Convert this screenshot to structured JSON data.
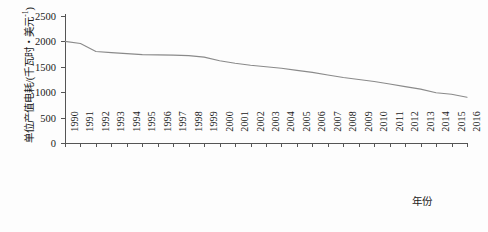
{
  "chart_data": {
    "type": "line",
    "title": "",
    "xlabel": "年份",
    "ylabel": "单位产值电耗/(千瓦时・美元",
    "ylabel_exponent": "-1",
    "ylabel_suffix": ")",
    "x": [
      1990,
      1991,
      1992,
      1993,
      1994,
      1995,
      1996,
      1997,
      1998,
      1999,
      2000,
      2001,
      2002,
      2003,
      2004,
      2005,
      2006,
      2007,
      2008,
      2009,
      2010,
      2011,
      2012,
      2013,
      2014,
      2015,
      2016
    ],
    "categories": [
      "1990",
      "1991",
      "1992",
      "1993",
      "1994",
      "1995",
      "1996",
      "1997",
      "1998",
      "1999",
      "2000",
      "2001",
      "2002",
      "2003",
      "2004",
      "2005",
      "2006",
      "2007",
      "2008",
      "2009",
      "2010",
      "2011",
      "2012",
      "2013",
      "2014",
      "2015",
      "2016"
    ],
    "values": [
      2000,
      1960,
      1800,
      1780,
      1760,
      1740,
      1735,
      1730,
      1720,
      1690,
      1620,
      1570,
      1530,
      1500,
      1470,
      1430,
      1390,
      1340,
      1290,
      1250,
      1210,
      1160,
      1110,
      1060,
      990,
      960,
      900
    ],
    "series": [
      {
        "name": "单位产值电耗",
        "values": [
          2000,
          1960,
          1800,
          1780,
          1760,
          1740,
          1735,
          1730,
          1720,
          1690,
          1620,
          1570,
          1530,
          1500,
          1470,
          1430,
          1390,
          1340,
          1290,
          1250,
          1210,
          1160,
          1110,
          1060,
          990,
          960,
          900
        ]
      }
    ],
    "yticks": [
      0,
      500,
      1000,
      1500,
      2000,
      2500
    ],
    "ytick_labels": [
      "0",
      "500",
      "1000",
      "1500",
      "2000",
      "2500"
    ],
    "ylim": [
      0,
      2500
    ],
    "xlim": [
      1990,
      2016
    ],
    "grid": false,
    "legend": "none",
    "line_color": "#8a8a8a",
    "axis_color": "#555555"
  }
}
